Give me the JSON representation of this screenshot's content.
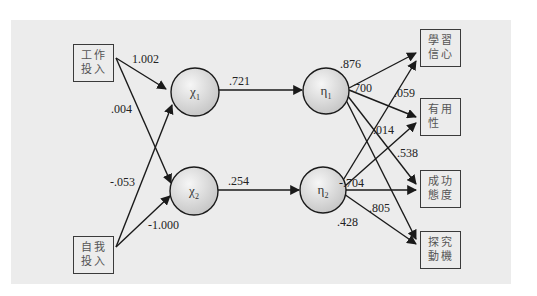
{
  "diagram": {
    "type": "structural-equation-path-model",
    "observed_inputs": [
      {
        "id": "work",
        "line1": "工作",
        "line2": "投入"
      },
      {
        "id": "self",
        "line1": "自我",
        "line2": "投入"
      }
    ],
    "latent_nodes": [
      {
        "id": "chi1",
        "symbol": "χ",
        "sub": "1"
      },
      {
        "id": "chi2",
        "symbol": "χ",
        "sub": "2"
      },
      {
        "id": "eta1",
        "symbol": "η",
        "sub": "1"
      },
      {
        "id": "eta2",
        "symbol": "η",
        "sub": "2"
      }
    ],
    "observed_outputs": [
      {
        "id": "conf",
        "line1": "學習",
        "line2": "信心"
      },
      {
        "id": "use",
        "line1": "有用",
        "line2": "性"
      },
      {
        "id": "att",
        "line1": "成功",
        "line2": "態度"
      },
      {
        "id": "mot",
        "line1": "探究",
        "line2": "動機"
      }
    ],
    "paths": [
      {
        "from": "工作投入",
        "to": "χ1",
        "weight": "1.002"
      },
      {
        "from": "工作投入",
        "to": "χ2",
        "weight": ".004"
      },
      {
        "from": "自我投入",
        "to": "χ1",
        "weight": "-.053"
      },
      {
        "from": "自我投入",
        "to": "χ2",
        "weight": "-1.000"
      },
      {
        "from": "χ1",
        "to": "η1",
        "weight": ".721"
      },
      {
        "from": "χ2",
        "to": "η2",
        "weight": ".254"
      },
      {
        "from": "η1",
        "to": "學習信心",
        "weight": ".876"
      },
      {
        "from": "η1",
        "to": "有用性",
        "weight": ".700"
      },
      {
        "from": "η2",
        "to": "學習信心",
        "weight": ".059"
      },
      {
        "from": "η2",
        "to": "有用性",
        "weight": ".014"
      },
      {
        "from": "η1",
        "to": "成功態度",
        "weight": ".538"
      },
      {
        "from": "η2",
        "to": "成功態度",
        "weight": "-.704"
      },
      {
        "from": "η1",
        "to": "探究動機",
        "weight": ".805"
      },
      {
        "from": "η2",
        "to": "探究動機",
        "weight": ".428"
      }
    ]
  },
  "labels": {
    "w_work_chi1": "1.002",
    "w_work_chi2": ".004",
    "w_self_chi1": "-.053",
    "w_self_chi2": "-1.000",
    "w_chi1_eta1": ".721",
    "w_chi2_eta2": ".254",
    "w_eta1_conf": ".876",
    "w_eta1_use": ".700",
    "w_eta2_conf": ".059",
    "w_eta2_use": ".014",
    "w_eta1_att": ".538",
    "w_eta2_att": "-.704",
    "w_eta1_mot": ".805",
    "w_eta2_mot": ".428"
  },
  "colors": {
    "panel": "#ececec",
    "stroke": "#1a1a1a",
    "circle_fill_center": "#f4f4f4",
    "circle_fill_edge": "#c8c8c8"
  }
}
